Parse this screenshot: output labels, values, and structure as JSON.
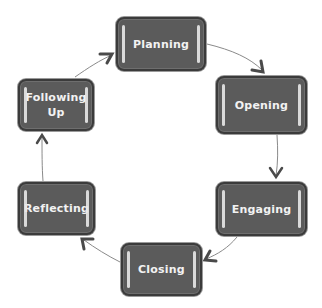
{
  "diagram": {
    "type": "cycle",
    "colors": {
      "node_fill": "#5b5b5b",
      "node_border": "#3b3b3b",
      "node_text": "#f2f2f2",
      "highlight_bar": "#e8e8e8",
      "arrow": "#555555"
    },
    "nodes": [
      {
        "id": "planning",
        "label": "Planning"
      },
      {
        "id": "opening",
        "label": "Opening"
      },
      {
        "id": "engaging",
        "label": "Engaging"
      },
      {
        "id": "closing",
        "label": "Closing"
      },
      {
        "id": "reflecting",
        "label": "Reflecting"
      },
      {
        "id": "following-up",
        "label": "Following\nUp"
      }
    ],
    "edges": [
      {
        "from": "planning",
        "to": "opening"
      },
      {
        "from": "opening",
        "to": "engaging"
      },
      {
        "from": "engaging",
        "to": "closing"
      },
      {
        "from": "closing",
        "to": "reflecting"
      },
      {
        "from": "reflecting",
        "to": "following-up"
      },
      {
        "from": "following-up",
        "to": "planning"
      }
    ]
  }
}
